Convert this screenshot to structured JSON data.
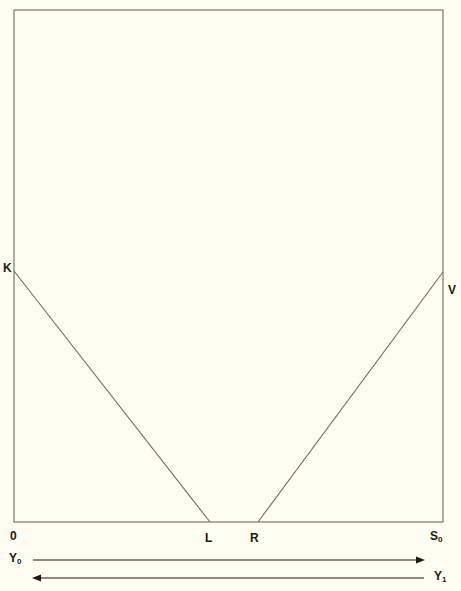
{
  "figure": {
    "type": "geometric-diagram",
    "background_color": "#fdfdf1",
    "stroke_color": "#6e6e5e",
    "text_color": "#1a1a14",
    "canvas": {
      "width": 461,
      "height": 591
    },
    "frame": {
      "name": "bounding-rectangle",
      "x0": 14,
      "y0": 10,
      "x1": 443,
      "y1": 522
    },
    "vertices": [
      {
        "id": "K",
        "label": "K",
        "x": 14,
        "y": 271
      },
      {
        "id": "V",
        "label": "V",
        "x": 443,
        "y": 272
      },
      {
        "id": "L",
        "label": "L",
        "x": 210,
        "y": 522
      },
      {
        "id": "R",
        "label": "R",
        "x": 258,
        "y": 522
      },
      {
        "id": "O",
        "label": "0",
        "x": 14,
        "y": 522
      },
      {
        "id": "S0",
        "label": "S",
        "sub": "0",
        "x": 443,
        "y": 522
      }
    ],
    "segments": [
      {
        "name": "segment-KL",
        "from": "K",
        "to": "L",
        "x1": 14,
        "y1": 271,
        "x2": 210,
        "y2": 522
      },
      {
        "name": "segment-RV",
        "from": "R",
        "to": "V",
        "x1": 258,
        "y1": 522,
        "x2": 443,
        "y2": 272
      }
    ],
    "axes": [
      {
        "name": "axis-Y0",
        "label": "Y",
        "sub": "0",
        "direction": "right",
        "x1": 33,
        "y1": 560,
        "x2": 424,
        "y2": 560
      },
      {
        "name": "axis-Y1",
        "label": "Y",
        "sub": "1",
        "direction": "left",
        "x1": 33,
        "y1": 578,
        "x2": 424,
        "y2": 578
      }
    ]
  }
}
